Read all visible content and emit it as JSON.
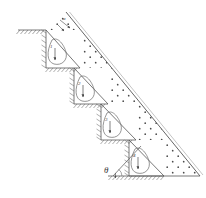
{
  "figure": {
    "type": "engineering-diagram",
    "width": 206,
    "height": 198,
    "background": "#ffffff",
    "line_color": "#555555",
    "soil_dot_color": "#4a4a4a",
    "hatch_color": "#666666"
  },
  "labels": {
    "angle_theta": "θ",
    "top_dimension": "α",
    "wall_1": "1",
    "wall_2": "2",
    "wall_3": "3",
    "wall_4": "4"
  },
  "geometry": {
    "slope_line": {
      "x1": 66,
      "y1": 12,
      "x2": 200,
      "y2": 176
    },
    "ground_surface_left": {
      "x1": 18,
      "y1": 30,
      "x2": 46,
      "y2": 30
    },
    "baseline_bottom": {
      "x1": 108,
      "y1": 176,
      "x2": 200,
      "y2": 176
    },
    "steps": [
      {
        "id": 1,
        "top_y": 30,
        "base_y": 68,
        "back_x": 46,
        "toe_x": 80
      },
      {
        "id": 2,
        "top_y": 68,
        "base_y": 104,
        "back_x": 74,
        "toe_x": 108
      },
      {
        "id": 3,
        "top_y": 104,
        "base_y": 140,
        "back_x": 101,
        "toe_x": 136
      },
      {
        "id": 4,
        "top_y": 140,
        "base_y": 176,
        "back_x": 129,
        "toe_x": 164
      }
    ]
  },
  "annotations": {
    "weight_arrows": 4,
    "slip_surfaces": 4,
    "description": "Four terraced wall blocks each containing a curved slip surface and a vertical load arrow; dotted region denotes granular backfill bounded above-right by the slope face."
  }
}
